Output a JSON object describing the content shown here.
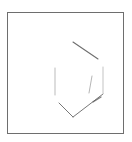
{
  "diagram": {
    "type": "chemical-structure",
    "frame": {
      "border_color": "#6e6e6e",
      "background": "#ffffff"
    },
    "bond_color": "#555555",
    "bonds": [
      {
        "id": "top",
        "x1": 73,
        "y1": 42,
        "x2": 98,
        "y2": 59,
        "width": 1.1,
        "opacity": 0.85
      },
      {
        "id": "right",
        "x1": 103,
        "y1": 67,
        "x2": 103,
        "y2": 93,
        "width": 0.8,
        "opacity": 0.45
      },
      {
        "id": "bottom-right",
        "x1": 103,
        "y1": 94,
        "x2": 73,
        "y2": 117,
        "width": 1.0,
        "opacity": 0.8
      },
      {
        "id": "bottom-right-double",
        "x1": 101,
        "y1": 97,
        "x2": 93,
        "y2": 102,
        "width": 1.3,
        "opacity": 0.75
      },
      {
        "id": "bottom-left",
        "x1": 73,
        "y1": 117,
        "x2": 59,
        "y2": 103,
        "width": 1.0,
        "opacity": 0.8
      },
      {
        "id": "left",
        "x1": 55,
        "y1": 68,
        "x2": 55,
        "y2": 95,
        "width": 0.8,
        "opacity": 0.5
      },
      {
        "id": "inner",
        "x1": 92,
        "y1": 76,
        "x2": 89,
        "y2": 93,
        "width": 0.8,
        "opacity": 0.55
      }
    ]
  }
}
